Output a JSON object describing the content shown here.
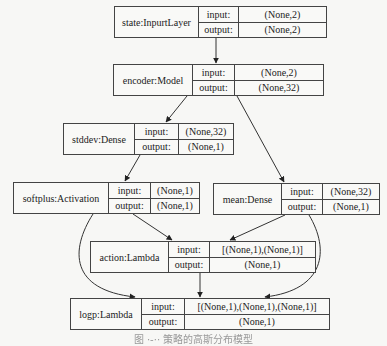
{
  "diagram": {
    "type": "keras-model-plot",
    "nodes": [
      {
        "id": "state",
        "label": "state:InpurtLayer",
        "input_label": "input:",
        "output_label": "output:",
        "input": "(None,2)",
        "output": "(None,2)"
      },
      {
        "id": "encoder",
        "label": "encoder:Model",
        "input_label": "input:",
        "output_label": "output:",
        "input": "(None,2)",
        "output": "(None,32)"
      },
      {
        "id": "stddev",
        "label": "stddev:Dense",
        "input_label": "input:",
        "output_label": "output:",
        "input": "(None,32)",
        "output": "(None,1)"
      },
      {
        "id": "softplus",
        "label": "softplus:Activation",
        "input_label": "input:",
        "output_label": "output:",
        "input": "(None,1)",
        "output": "(None,1)"
      },
      {
        "id": "mean",
        "label": "mean:Dense",
        "input_label": "input:",
        "output_label": "output:",
        "input": "(None,32)",
        "output": "(None,1)"
      },
      {
        "id": "action",
        "label": "action:Lambda",
        "input_label": "input:",
        "output_label": "output:",
        "input": "[(None,1),(None,1)]",
        "output": "(None,1)"
      },
      {
        "id": "logp",
        "label": "logp:Lambda",
        "input_label": "input:",
        "output_label": "output:",
        "input": "[(None,1),(None,1),(None,1)]",
        "output": "(None,1)"
      }
    ],
    "edges": [
      [
        "state",
        "encoder"
      ],
      [
        "encoder",
        "stddev"
      ],
      [
        "encoder",
        "mean"
      ],
      [
        "stddev",
        "softplus"
      ],
      [
        "softplus",
        "action"
      ],
      [
        "mean",
        "action"
      ],
      [
        "softplus",
        "logp"
      ],
      [
        "action",
        "logp"
      ],
      [
        "mean",
        "logp"
      ]
    ],
    "caption": "图 ·-·· 策略的高斯分布模型"
  }
}
